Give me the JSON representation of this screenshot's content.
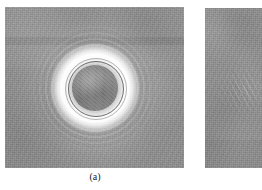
{
  "figure": {
    "background_color": "#ffffff",
    "panels": [
      {
        "id": "panel-a",
        "caption": "(a)",
        "caption_visible": true,
        "cropped": false,
        "base_color": "#8e8e8e",
        "content_description": "grayscale micrograph with concentric diffraction rings",
        "feature": {
          "name": "concentric-ring-pattern",
          "center_x_pct": 50,
          "center_y_pct": 53,
          "core_color": "#909090",
          "halo_color": "#ffffff",
          "ring_count": 5
        }
      },
      {
        "id": "panel-b",
        "caption": "",
        "caption_visible": false,
        "cropped": true,
        "base_color": "#909090",
        "content_description": "grayscale micrograph, partially cut off at image edge, faint diagonal streaks",
        "feature": {
          "name": "diagonal-streaks",
          "center_x_pct": 62,
          "center_y_pct": 48,
          "core_color": "#9a9a9a",
          "halo_color": "#d8d8d8",
          "ring_count": 0
        }
      }
    ]
  }
}
